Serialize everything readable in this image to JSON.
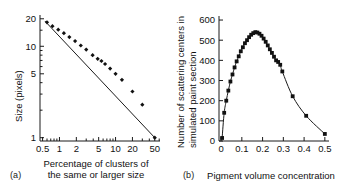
{
  "figure": {
    "panel_a_label": "(a)",
    "panel_b_label": "(b)"
  },
  "chart_data": [
    {
      "panel": "(a)",
      "type": "scatter",
      "title": "",
      "xlabel": "Percentage of clusters of the same or larger size",
      "xlabel_line1": "Percentage of clusters of",
      "xlabel_line2": "the same or larger size",
      "ylabel": "Size (pixels)",
      "xscale": "log",
      "yscale": "log",
      "xlim": [
        0.45,
        62
      ],
      "ylim": [
        0.92,
        22
      ],
      "xticks": [
        0.5,
        1,
        2,
        5,
        10,
        20,
        50
      ],
      "xticklabels": [
        "0.5",
        "1",
        "2",
        "5",
        "10",
        "20",
        "50"
      ],
      "yticks": [
        1,
        5,
        10,
        20
      ],
      "yticklabels": [
        "1",
        "5",
        "10",
        "20"
      ],
      "grid": false,
      "legend": "none",
      "marker": "filled-diamond",
      "fit_line": {
        "x": [
          0.55,
          50
        ],
        "y": [
          18.9,
          1.0
        ]
      },
      "x": [
        0.6,
        0.75,
        0.95,
        1.2,
        1.5,
        1.9,
        2.4,
        3.0,
        3.9,
        4.8,
        5.6,
        6.5,
        8.0,
        10.0,
        13.0,
        20.0,
        30.0,
        50.0
      ],
      "y": [
        18.3,
        16.6,
        15.2,
        13.9,
        12.6,
        11.4,
        10.2,
        9.2,
        8.0,
        7.3,
        6.9,
        6.4,
        5.7,
        5.0,
        4.3,
        3.2,
        2.3,
        1.0
      ]
    },
    {
      "panel": "(b)",
      "type": "scatter",
      "title": "",
      "xlabel": "Pigment volume concentration",
      "ylabel": "Number of scattering centers in simulated paint section",
      "ylabel_line1": "Number of scattering centers in",
      "ylabel_line2": "simulated paint section",
      "xscale": "linear",
      "yscale": "linear",
      "xlim": [
        -0.01,
        0.52
      ],
      "ylim": [
        0,
        620
      ],
      "xticks": [
        0,
        0.1,
        0.2,
        0.3,
        0.4,
        0.5
      ],
      "xticklabels": [
        "0",
        "0.1",
        "0.2",
        "0.3",
        "0.4",
        "0.5"
      ],
      "yticks": [
        0,
        100,
        200,
        300,
        400,
        500,
        600
      ],
      "yticklabels": [
        "0",
        "100",
        "200",
        "300",
        "400",
        "500",
        "600"
      ],
      "grid": false,
      "legend": "none",
      "marker": "filled-square",
      "x": [
        0.005,
        0.015,
        0.025,
        0.035,
        0.045,
        0.055,
        0.065,
        0.075,
        0.085,
        0.095,
        0.105,
        0.115,
        0.125,
        0.135,
        0.145,
        0.155,
        0.165,
        0.175,
        0.185,
        0.195,
        0.205,
        0.215,
        0.225,
        0.235,
        0.245,
        0.255,
        0.265,
        0.275,
        0.285,
        0.295,
        0.345,
        0.41,
        0.5
      ],
      "y": [
        15,
        140,
        200,
        250,
        295,
        330,
        365,
        395,
        420,
        445,
        465,
        485,
        500,
        515,
        527,
        535,
        540,
        538,
        532,
        522,
        508,
        492,
        474,
        455,
        437,
        418,
        400,
        392,
        378,
        345,
        222,
        125,
        35
      ]
    }
  ]
}
